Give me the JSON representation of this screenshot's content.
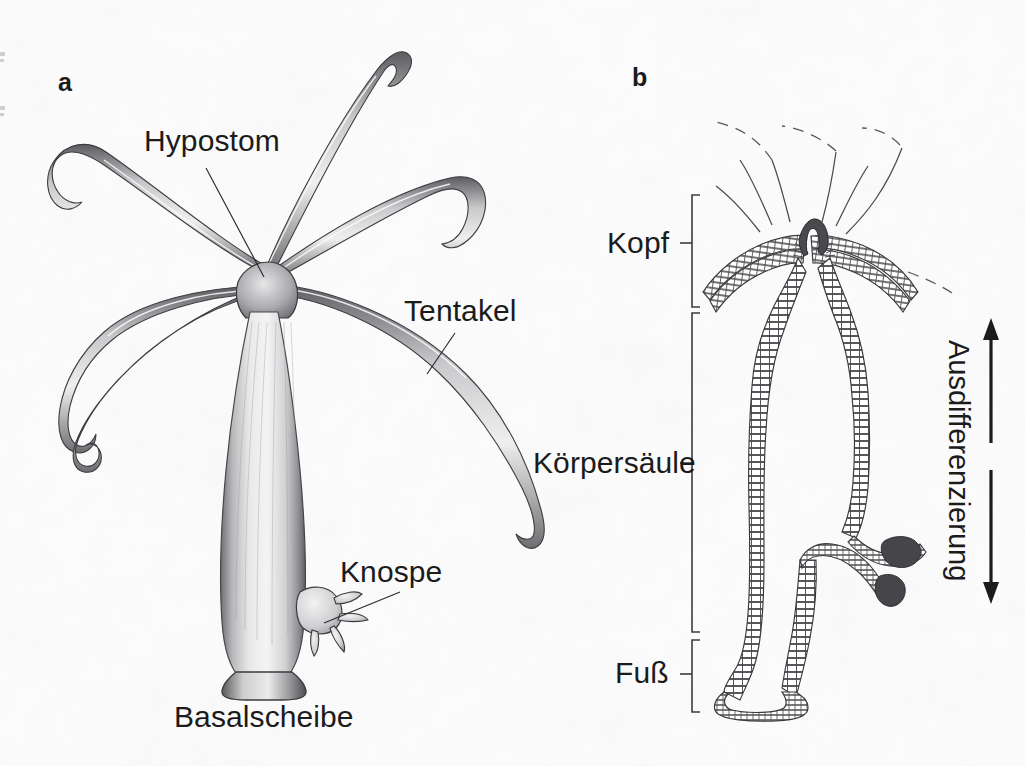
{
  "figure": {
    "type": "scientific-illustration",
    "language": "de",
    "background_color": "#fdfdfd",
    "ink_color": "#1b1b1b",
    "width": 1025,
    "height": 766
  },
  "panels": [
    {
      "letter": "a",
      "name": "habitus-drawing",
      "description": "shaded pencil drawing of a whole Hydra polyp with tentacles and a bud",
      "letter_pos": {
        "x": 58,
        "y": 70
      }
    },
    {
      "letter": "b",
      "name": "schematic-section",
      "description": "line schematic longitudinal section showing cell layers, regions and differentiation axis",
      "letter_pos": {
        "x": 632,
        "y": 65
      }
    }
  ],
  "panel_a": {
    "annotations": [
      {
        "id": "hypostom",
        "label": "Hypostom",
        "label_pos": {
          "x": 144,
          "y": 126
        },
        "leader": {
          "x1": 206,
          "y1": 168,
          "x2": 264,
          "y2": 277
        }
      },
      {
        "id": "tentakel",
        "label": "Tentakel",
        "label_pos": {
          "x": 404,
          "y": 296
        },
        "leader": {
          "x1": 455,
          "y1": 333,
          "x2": 427,
          "y2": 374
        }
      },
      {
        "id": "knospe",
        "label": "Knospe",
        "label_pos": {
          "x": 340,
          "y": 557
        },
        "leader": {
          "x1": 400,
          "y1": 592,
          "x2": 324,
          "y2": 623
        }
      },
      {
        "id": "basalscheibe",
        "label": "Basalscheibe",
        "label_pos": {
          "x": 174,
          "y": 702
        },
        "leader": null
      }
    ]
  },
  "panel_b": {
    "regions": [
      {
        "id": "kopf",
        "label": "Kopf",
        "label_pos": {
          "x": 607,
          "y": 228
        },
        "bracket": {
          "x": 692,
          "y_top": 195,
          "y_bottom": 307,
          "tick_y": 243
        }
      },
      {
        "id": "koerpersaeule",
        "label": "Körpersäule",
        "label_pos": {
          "x": 533,
          "y": 448
        },
        "bracket": {
          "x": 692,
          "y_top": 313,
          "y_bottom": 632,
          "tick_y": 463
        }
      },
      {
        "id": "fuss",
        "label": "Fuß",
        "label_pos": {
          "x": 615,
          "y": 658
        },
        "bracket": {
          "x": 692,
          "y_top": 640,
          "y_bottom": 712,
          "tick_y": 674
        }
      }
    ],
    "axis": {
      "id": "ausdifferenzierung",
      "label": "Ausdifferenzierung",
      "label_pos": {
        "x": 975,
        "y": 340
      },
      "rotation_deg": 90,
      "arrows": [
        {
          "direction": "up",
          "x": 991,
          "y_tail": 443,
          "y_head": 322
        },
        {
          "direction": "down",
          "x": 991,
          "y_tail": 470,
          "y_head": 600
        }
      ]
    }
  }
}
